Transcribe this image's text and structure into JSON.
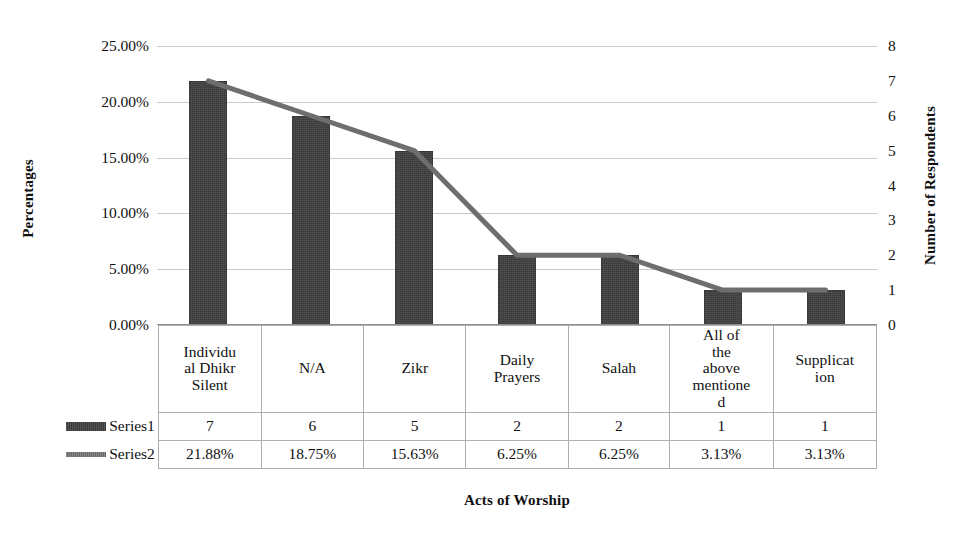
{
  "chart_data": {
    "type": "bar",
    "title": "",
    "xlabel": "Acts of Worship",
    "ylabel": "Percentages",
    "y2label": "Number of Respondents",
    "categories": [
      "Individual Dhikr Silent",
      "N/A",
      "Zikr",
      "Daily Prayers",
      "Salah",
      "All of the above mentioned",
      "Supplication"
    ],
    "category_display": [
      "Individu\nal Dhikr\nSilent",
      "N/A",
      "Zikr",
      "Daily\nPrayers",
      "Salah",
      "All of\nthe\nabove\nmentione\nd",
      "Supplicat\nion"
    ],
    "series": [
      {
        "name": "Series1",
        "type": "bar",
        "axis": "right",
        "values": [
          7,
          6,
          5,
          2,
          2,
          1,
          1
        ],
        "labels": [
          "7",
          "6",
          "5",
          "2",
          "2",
          "1",
          "1"
        ],
        "color": "#3f3f3f"
      },
      {
        "name": "Series2",
        "type": "line",
        "axis": "left",
        "values": [
          21.88,
          18.75,
          15.63,
          6.25,
          6.25,
          3.13,
          3.13
        ],
        "labels": [
          "21.88%",
          "18.75%",
          "15.63%",
          "6.25%",
          "6.25%",
          "3.13%",
          "3.13%"
        ],
        "color": "#6e6e6e"
      }
    ],
    "ylim": [
      0,
      25
    ],
    "y2lim": [
      0,
      8
    ],
    "yticks": [
      0,
      5,
      10,
      15,
      20,
      25
    ],
    "ytick_labels": [
      "0.00%",
      "5.00%",
      "10.00%",
      "15.00%",
      "20.00%",
      "25.00%"
    ],
    "y2ticks": [
      0,
      1,
      2,
      3,
      4,
      5,
      6,
      7,
      8
    ],
    "y2tick_labels": [
      "0",
      "1",
      "2",
      "3",
      "4",
      "5",
      "6",
      "7",
      "8"
    ],
    "grid": true,
    "legend_position": "data-table"
  },
  "table": {
    "series_labels": [
      "Series1",
      "Series2"
    ],
    "rows": [
      [
        "7",
        "6",
        "5",
        "2",
        "2",
        "1",
        "1"
      ],
      [
        "21.88%",
        "18.75%",
        "15.63%",
        "6.25%",
        "6.25%",
        "3.13%",
        "3.13%"
      ]
    ]
  }
}
